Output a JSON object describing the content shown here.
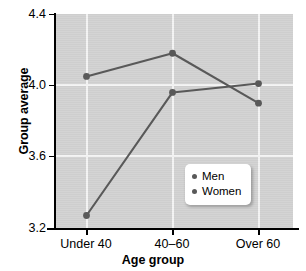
{
  "chart_data": {
    "type": "line",
    "title": "",
    "xlabel": "Age group",
    "ylabel": "Group average",
    "categories": [
      "Under 40",
      "40–60",
      "Over 60"
    ],
    "series": [
      {
        "name": "Men",
        "values": [
          4.05,
          4.18,
          3.9
        ],
        "color": "#595959"
      },
      {
        "name": "Women",
        "values": [
          3.27,
          3.96,
          4.01
        ],
        "color": "#595959"
      }
    ],
    "ylim": [
      3.2,
      4.4
    ],
    "yticks": [
      "3.2",
      "3.6",
      "4.0",
      "4.4"
    ],
    "ytick_values": [
      3.2,
      3.6,
      4.0,
      4.4
    ],
    "grid": true,
    "legend_position": "center-right",
    "plot_background": "#d2d2d2",
    "gridline_color": "#f4f4f4"
  },
  "legend": {
    "items": [
      {
        "label": "Men"
      },
      {
        "label": "Women"
      }
    ]
  }
}
